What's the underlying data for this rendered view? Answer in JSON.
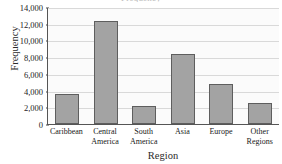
{
  "chart_data": {
    "type": "bar",
    "title": "Frequency",
    "xlabel": "Region",
    "ylabel": "Frequency",
    "categories": [
      "Caribbean",
      "Central America",
      "South America",
      "Asia",
      "Europe",
      "Other Regions"
    ],
    "category_lines": [
      [
        "Caribbean"
      ],
      [
        "Central",
        "America"
      ],
      [
        "South",
        "America"
      ],
      [
        "Asia"
      ],
      [
        "Europe"
      ],
      [
        "Other",
        "Regions"
      ]
    ],
    "values": [
      3600,
      12300,
      2200,
      8400,
      4800,
      2500
    ],
    "ylim": [
      0,
      14000
    ],
    "ytick_step": 2000,
    "yticks": [
      0,
      2000,
      4000,
      6000,
      8000,
      10000,
      12000,
      14000
    ],
    "ytick_labels": [
      "0",
      "2,000",
      "4,000",
      "6,000",
      "8,000",
      "10,000",
      "12,000",
      "14,000"
    ],
    "grid": true,
    "legend": false,
    "bar_color": "#a3a3a3",
    "bar_border_color": "#5e5e5e",
    "gridline_color": "#d9d9d9",
    "axis_color": "#555555",
    "plot_background": "#fbfbfb"
  }
}
